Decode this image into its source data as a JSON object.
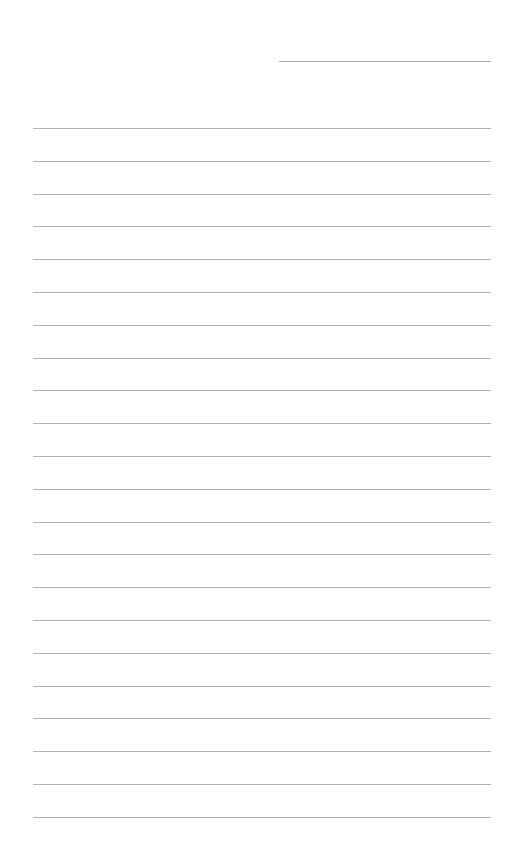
{
  "page": {
    "type": "lined-paper",
    "background_color": "#ffffff",
    "line_color": "#b3b3b3",
    "header_line": {
      "label": "",
      "x": 279,
      "y": 61,
      "width": 212
    },
    "rules": {
      "count": 22,
      "start_y": 128,
      "spacing": 32.8,
      "left": 33,
      "width": 458
    }
  }
}
